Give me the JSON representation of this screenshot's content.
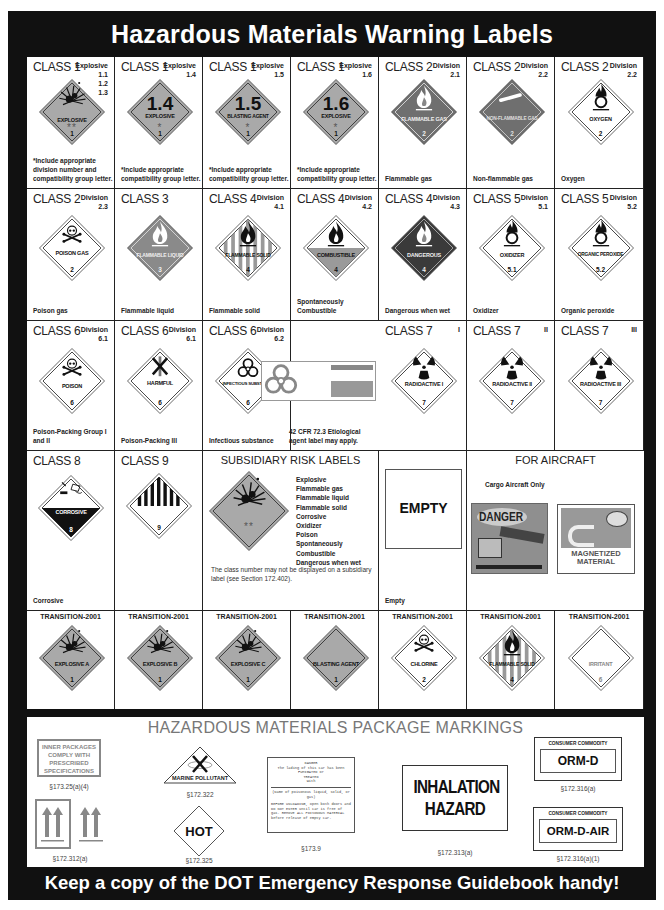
{
  "header": {
    "title": "Hazardous Materials Warning Labels"
  },
  "colors": {
    "frame": "#111111",
    "label_gray": "#a9a9a9",
    "dark_gray": "#555555",
    "text": "#222222",
    "section_gray": "#777777"
  },
  "rows": [
    {
      "cells": [
        {
          "title": "CLASS 1",
          "division": "Explosive\n1.1\n1.2\n1.3",
          "icon": "explosion-icon",
          "label": "EXPLOSIVE",
          "marks": "**",
          "number": "1",
          "caption": "*Include appropriate division number and compatibility group letter."
        },
        {
          "title": "CLASS 1",
          "division": "Explosive\n1.4",
          "big": "1.4",
          "label": "EXPLOSIVE",
          "marks": "*",
          "number": "1",
          "caption": "*Include appropriate compatibility group letter."
        },
        {
          "title": "CLASS 1",
          "division": "Explosive\n1.5",
          "big": "1.5",
          "label": "BLASTING AGENT",
          "marks": "*",
          "number": "1",
          "caption": "*Include appropriate compatibility group letter."
        },
        {
          "title": "CLASS 1",
          "division": "Explosive\n1.6",
          "big": "1.6",
          "label": "EXPLOSIVE",
          "marks": "*",
          "number": "1",
          "caption": "*Include appropriate compatibility group letter."
        },
        {
          "title": "CLASS 2",
          "division": "Division\n2.1",
          "icon": "flame-icon",
          "label": "FLAMMABLE GAS",
          "number": "2",
          "caption": "Flammable gas"
        },
        {
          "title": "CLASS 2",
          "division": "Division\n2.2",
          "icon": "cylinder-icon",
          "label": "NON-FLAMMABLE GAS",
          "number": "2",
          "caption": "Non-flammable gas"
        },
        {
          "title": "CLASS 2",
          "division": "Division\n2.2",
          "icon": "flame-over-circle-icon",
          "label": "OXYGEN",
          "number": "2",
          "caption": "Oxygen"
        }
      ]
    },
    {
      "cells": [
        {
          "title": "CLASS 2",
          "division": "Division\n2.3",
          "icon": "skull-crossbones-icon",
          "label": "POISON GAS",
          "number": "2",
          "caption": "Poison gas"
        },
        {
          "title": "CLASS 3",
          "division": "",
          "icon": "flame-icon",
          "label": "FLAMMABLE LIQUID",
          "number": "3",
          "caption": "Flammable liquid"
        },
        {
          "title": "CLASS 4",
          "division": "Division\n4.1",
          "icon": "flame-icon",
          "label": "FLAMMABLE SOLID",
          "number": "4",
          "caption": "Flammable solid"
        },
        {
          "title": "CLASS 4",
          "division": "Division\n4.2",
          "icon": "flame-icon",
          "label": "COMBUSTIBLE",
          "number": "4",
          "caption": "Spontaneously Combustible"
        },
        {
          "title": "CLASS 4",
          "division": "Division\n4.3",
          "icon": "flame-icon",
          "label": "DANGEROUS",
          "number": "4",
          "caption": "Dangerous when wet"
        },
        {
          "title": "CLASS 5",
          "division": "Division\n5.1",
          "icon": "flame-over-circle-icon",
          "label": "OXIDIZER",
          "number": "5.1",
          "caption": "Oxidizer"
        },
        {
          "title": "CLASS 5",
          "division": "Division\n5.2",
          "icon": "flame-over-circle-icon",
          "label": "ORGANIC PEROXIDE",
          "number": "5.2",
          "caption": "Organic peroxide"
        }
      ]
    },
    {
      "cells": [
        {
          "title": "CLASS 6",
          "division": "Division\n6.1",
          "icon": "skull-crossbones-icon",
          "label": "POISON",
          "number": "6",
          "caption": "Poison-Packing Group I and II"
        },
        {
          "title": "CLASS 6",
          "division": "Division\n6.1",
          "icon": "crossed-wheat-icon",
          "label": "HARMFUL",
          "sublabel": "STOW AWAY FROM FOODSTUFFS",
          "number": "6",
          "caption": "Poison-Packing III"
        },
        {
          "title": "CLASS 6",
          "division": "Division\n6.2",
          "icon": "biohazard-icon",
          "label": "INFECTIOUS SUBSTANCE",
          "number": "6",
          "caption": "Infectious substance"
        },
        {
          "title": "",
          "division": "",
          "icon": "biohazard-icon",
          "label": "ETIOLOGIC AGENTS",
          "caption": "42 CFR 72.3 Etiological agent label may apply."
        },
        {
          "title": "CLASS 7",
          "division": "I",
          "icon": "radiation-icon",
          "label": "RADIOACTIVE I",
          "number": "7",
          "caption": ""
        },
        {
          "title": "CLASS 7",
          "division": "II",
          "icon": "radiation-icon",
          "label": "RADIOACTIVE II",
          "number": "7",
          "caption": ""
        },
        {
          "title": "CLASS 7",
          "division": "III",
          "icon": "radiation-icon",
          "label": "RADIOACTIVE III",
          "number": "7",
          "caption": ""
        }
      ]
    },
    {
      "cells": [
        {
          "title": "CLASS 8",
          "icon": "corrosive-icon",
          "label": "CORROSIVE",
          "number": "8",
          "caption": "Corrosive"
        },
        {
          "title": "CLASS 9",
          "icon": "stripes-icon",
          "label": "",
          "number": "9",
          "caption": ""
        }
      ],
      "subsidiary": {
        "title": "SUBSIDIARY RISK LABELS",
        "marks": "**",
        "list": [
          "Explosive",
          "Flammable gas",
          "Flammable liquid",
          "Flammable solid",
          "Corrosive",
          "Oxidizer",
          "Poison",
          "Spontaneously Combustible",
          "Dangerous when wet"
        ],
        "note": "The class number may not be displayed on a subsidiary label (see Section 172.402)."
      },
      "empty": {
        "label": "EMPTY",
        "caption": "Empty"
      },
      "aircraft": {
        "title": "FOR AIRCRAFT",
        "subtitle": "Cargo Aircraft Only",
        "danger": "DANGER",
        "magnet": "MAGNETIZED MATERIAL"
      }
    },
    {
      "cells": [
        {
          "title": "TRANSITION-2001",
          "label": "EXPLOSIVE A",
          "number": "1"
        },
        {
          "title": "TRANSITION-2001",
          "label": "EXPLOSIVE B",
          "number": "1"
        },
        {
          "title": "TRANSITION-2001",
          "label": "EXPLOSIVE C",
          "number": "1"
        },
        {
          "title": "TRANSITION-2001",
          "label": "BLASTING AGENT",
          "number": "1"
        },
        {
          "title": "TRANSITION-2001",
          "label": "CHLORINE",
          "number": "2"
        },
        {
          "title": "TRANSITION-2001",
          "label": "FLAMMABLE SOLID",
          "number": "4"
        },
        {
          "title": "TRANSITION-2001",
          "label": "IRRITANT",
          "number": "6"
        }
      ]
    }
  ],
  "package": {
    "title": "HAZARDOUS MATERIALS PACKAGE MARKINGS",
    "inner": {
      "lines": [
        "INNER PACKAGES",
        "COMPLY WITH",
        "PRESCRIBED",
        "SPECIFICATIONS"
      ],
      "ref": "§173.25(a)(4)"
    },
    "arrows": {
      "ref": "§172.312(a)"
    },
    "marine": {
      "label": "MARINE POLLUTANT",
      "ref": "§172.322"
    },
    "hot": {
      "label": "HOT",
      "ref": "§172.325"
    },
    "fumigated": {
      "lines": [
        "DANGER",
        "The lading of this car has been",
        "FUMIGATED or",
        "TREATED",
        "with"
      ],
      "line2": "(Name of poisonous liquid, solid, or gas)",
      "line3": "BEFORE UNLOADING, open both doors and DO NOT ENTER until car is free of gas. REMOVE ALL POISONOUS MATERIAL before release of empty car.",
      "ref": "§173.9"
    },
    "inhalation": {
      "line1": "INHALATION",
      "line2": "HAZARD",
      "ref": "§172.313(a)"
    },
    "ormd": {
      "header": "CONSUMER COMMODITY",
      "label": "ORM-D",
      "ref": "§172.316(a)"
    },
    "ormdair": {
      "header": "CONSUMER COMMODITY",
      "label": "ORM-D-AIR",
      "ref": "§172.316(a)(1)"
    }
  },
  "footer": {
    "text": "Keep a copy of the DOT Emergency Response Guidebook handy!"
  }
}
